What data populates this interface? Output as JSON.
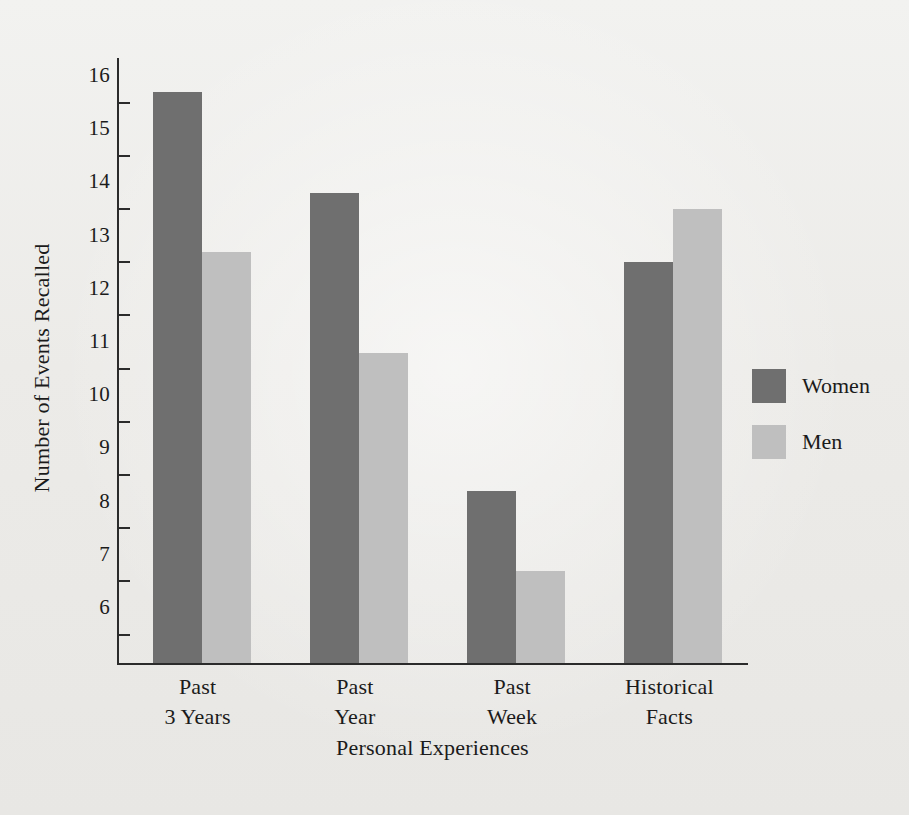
{
  "figure": {
    "background_color": "#efefed",
    "axis_color": "#2b2b2b"
  },
  "chart_data": {
    "type": "bar",
    "title": "",
    "xlabel": "Personal Experiences",
    "ylabel": "Number of Events Recalled",
    "categories": [
      "Past 3 Years",
      "Past Year",
      "Past Week",
      "Historical Facts"
    ],
    "category_lines": [
      [
        "Past",
        "3 Years"
      ],
      [
        "Past",
        "Year"
      ],
      [
        "Past",
        "Week"
      ],
      [
        "Historical",
        "Facts"
      ]
    ],
    "series": [
      {
        "name": "Women",
        "color": "#6f6f6f",
        "values": [
          15.7,
          13.8,
          8.2,
          12.5
        ]
      },
      {
        "name": "Men",
        "color": "#bfbfbf",
        "values": [
          12.7,
          10.8,
          6.7,
          13.5
        ]
      }
    ],
    "ylim": [
      5.0,
      16.3
    ],
    "ytick_labels": [
      "16",
      "15",
      "14",
      "13",
      "12",
      "11",
      "10",
      "9",
      "8",
      "7",
      "6"
    ],
    "ytick_values": [
      16,
      15,
      14,
      13,
      12,
      11,
      10,
      9,
      8,
      7,
      6
    ],
    "minor_tick_values": [
      15.5,
      14.5,
      13.5,
      12.5,
      11.5,
      10.5,
      9.5,
      8.5,
      7.5,
      6.5,
      5.5
    ],
    "grid": false,
    "legend_position": "right"
  },
  "legend": {
    "entries": [
      {
        "label": "Women",
        "color": "#6f6f6f"
      },
      {
        "label": "Men",
        "color": "#bfbfbf"
      }
    ]
  }
}
